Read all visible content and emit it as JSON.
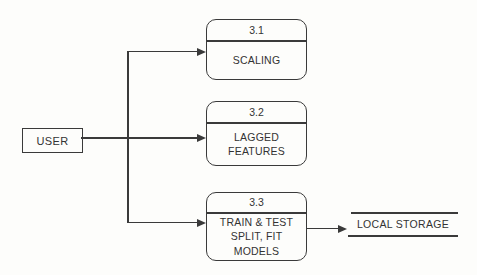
{
  "diagram": {
    "type": "data-flow-diagram",
    "colors": {
      "background": "#fdfdfb",
      "stroke": "#3a3a3a",
      "text": "#333333"
    },
    "user_entity": {
      "label": "USER"
    },
    "processes": [
      {
        "number": "3.1",
        "name_lines": [
          "SCALING"
        ]
      },
      {
        "number": "3.2",
        "name_lines": [
          "LAGGED",
          "FEATURES"
        ]
      },
      {
        "number": "3.3",
        "name_lines": [
          "TRAIN & TEST",
          "SPLIT, FIT",
          "MODELS"
        ]
      }
    ],
    "datastore": {
      "label": "LOCAL STORAGE"
    }
  }
}
